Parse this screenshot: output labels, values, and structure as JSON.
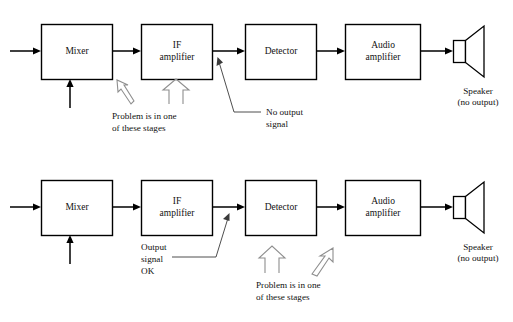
{
  "figure": {
    "type": "block-diagram",
    "background": "#ffffff",
    "stroke_color": "#000000",
    "annotation_arrow_color": "#8e8e8e"
  },
  "diagrams": [
    {
      "id": "top",
      "blocks": [
        {
          "label": "Mixer"
        },
        {
          "label_line1": "IF",
          "label_line2": "amplifier"
        },
        {
          "label": "Detector"
        },
        {
          "label_line1": "Audio",
          "label_line2": "amplifier"
        }
      ],
      "output_device": {
        "line1": "Speaker",
        "line2": "(no output)"
      },
      "annotations": [
        {
          "id": "problem",
          "line1": "Problem is in one",
          "line2": "of these stages"
        },
        {
          "id": "nosignal",
          "line1": "No output",
          "line2": "signal"
        }
      ]
    },
    {
      "id": "bottom",
      "blocks": [
        {
          "label": "Mixer"
        },
        {
          "label_line1": "IF",
          "label_line2": "amplifier"
        },
        {
          "label": "Detector"
        },
        {
          "label_line1": "Audio",
          "label_line2": "amplifier"
        }
      ],
      "output_device": {
        "line1": "Speaker",
        "line2": "(no output)"
      },
      "annotations": [
        {
          "id": "outputok",
          "line1": "Output",
          "line2": "signal",
          "line3": "OK"
        },
        {
          "id": "problem",
          "line1": "Problem is in one",
          "line2": "of these stages"
        }
      ]
    }
  ]
}
